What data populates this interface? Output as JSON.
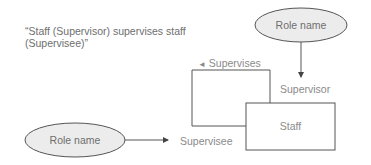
{
  "description": {
    "line1": "“Staff (Supervisor) supervises staff",
    "line2": "(Supervisee)”"
  },
  "top_role": {
    "label": "Role name"
  },
  "bottom_role": {
    "label": "Role name"
  },
  "entity": {
    "label": "Staff"
  },
  "relationship": {
    "label": "Supervises",
    "direction_glyph": "◄"
  },
  "roles": {
    "supervisor": "Supervisor",
    "supervisee": "Supervisee"
  },
  "colors": {
    "ellipse_fill": "#ececec",
    "stroke": "#555555",
    "text": "#7a7a7a"
  }
}
